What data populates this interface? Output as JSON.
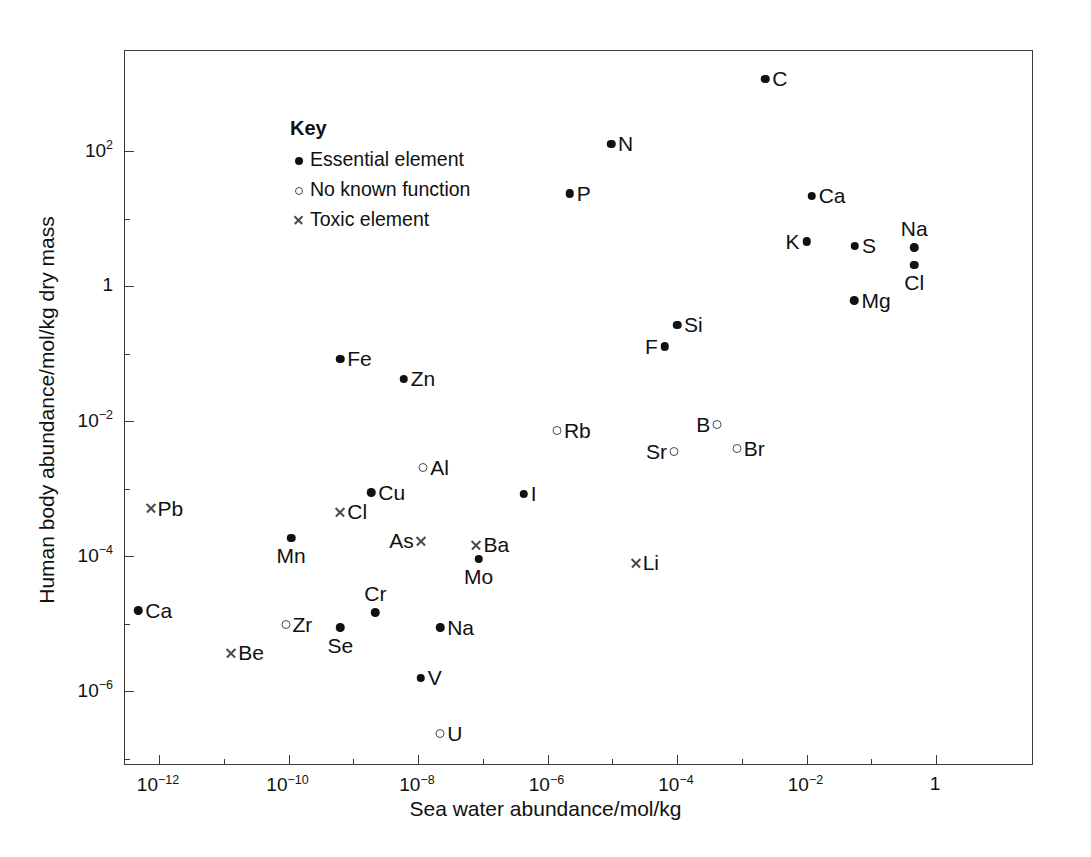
{
  "chart_data": {
    "type": "scatter",
    "title": "",
    "xlabel": "Sea water abundance/mol/kg",
    "ylabel": "Human body abundance/mol/kg dry mass",
    "xscale": "log",
    "yscale": "log",
    "xlim": [
      6.3e-14,
      0.63
    ],
    "ylim": [
      1.5e-07,
      1600.0
    ],
    "grid": false,
    "legend_position": "top-left",
    "x_tick_labels": [
      "10⁻¹²",
      "10⁻¹⁰",
      "10⁻⁸",
      "10⁻⁶",
      "10⁻⁴",
      "10⁻²",
      "1"
    ],
    "x_tick_values": [
      1e-12,
      1e-10,
      1e-08,
      1e-06,
      0.0001,
      0.01,
      1
    ],
    "y_tick_labels": [
      "10²",
      "1",
      "10⁻²",
      "10⁻⁴",
      "10⁻⁶"
    ],
    "y_tick_values": [
      100,
      1,
      0.01,
      0.0001,
      1e-06
    ],
    "x_minor_values": [
      1e-11,
      1e-09,
      1e-07,
      1e-05,
      0.001,
      0.1
    ],
    "y_minor_values": [
      10,
      0.1,
      0.001,
      1e-05,
      1e-07
    ],
    "series": [
      {
        "name": "Essential element",
        "marker": "filled-circle"
      },
      {
        "name": "No known function",
        "marker": "open-circle"
      },
      {
        "name": "Toxic element",
        "marker": "cross"
      }
    ],
    "points": [
      {
        "label": "C",
        "x": 0.0023,
        "y": 1200.0,
        "marker": "filled-circle",
        "label_pos": "right"
      },
      {
        "label": "N",
        "x": 9.6e-06,
        "y": 130.0,
        "marker": "filled-circle",
        "label_pos": "right"
      },
      {
        "label": "P",
        "x": 2.2e-06,
        "y": 24.0,
        "marker": "filled-circle",
        "label_pos": "right"
      },
      {
        "label": "Ca",
        "x": 0.012,
        "y": 22.0,
        "marker": "filled-circle",
        "label_pos": "right"
      },
      {
        "label": "K",
        "x": 0.01,
        "y": 4.7,
        "marker": "filled-circle",
        "label_pos": "left"
      },
      {
        "label": "S",
        "x": 0.056,
        "y": 4.0,
        "marker": "filled-circle",
        "label_pos": "right"
      },
      {
        "label": "Na",
        "x": 0.46,
        "y": 3.8,
        "marker": "filled-circle",
        "label_pos": "above"
      },
      {
        "label": "Cl",
        "x": 0.46,
        "y": 2.1,
        "marker": "filled-circle",
        "label_pos": "below"
      },
      {
        "label": "Mg",
        "x": 0.055,
        "y": 0.63,
        "marker": "filled-circle",
        "label_pos": "right"
      },
      {
        "label": "Si",
        "x": 0.0001,
        "y": 0.27,
        "marker": "filled-circle",
        "label_pos": "right"
      },
      {
        "label": "F",
        "x": 6.5e-05,
        "y": 0.13,
        "marker": "filled-circle",
        "label_pos": "left"
      },
      {
        "label": "Fe",
        "x": 6.3e-10,
        "y": 0.085,
        "marker": "filled-circle",
        "label_pos": "right"
      },
      {
        "label": "Zn",
        "x": 6e-09,
        "y": 0.043,
        "marker": "filled-circle",
        "label_pos": "right"
      },
      {
        "label": "Rb",
        "x": 1.4e-06,
        "y": 0.0073,
        "marker": "open-circle",
        "label_pos": "right"
      },
      {
        "label": "B",
        "x": 0.00042,
        "y": 0.009,
        "marker": "open-circle",
        "label_pos": "left"
      },
      {
        "label": "Br",
        "x": 0.00084,
        "y": 0.004,
        "marker": "open-circle",
        "label_pos": "right"
      },
      {
        "label": "Sr",
        "x": 9e-05,
        "y": 0.0036,
        "marker": "open-circle",
        "label_pos": "left"
      },
      {
        "label": "Al",
        "x": 1.2e-08,
        "y": 0.0021,
        "marker": "open-circle",
        "label_pos": "right"
      },
      {
        "label": "Cu",
        "x": 1.9e-09,
        "y": 0.0009,
        "marker": "filled-circle",
        "label_pos": "right"
      },
      {
        "label": "I",
        "x": 4.3e-07,
        "y": 0.00085,
        "marker": "filled-circle",
        "label_pos": "right"
      },
      {
        "label": "Pb",
        "x": 7.4e-13,
        "y": 0.00052,
        "marker": "cross",
        "label_pos": "right"
      },
      {
        "label": "Cl",
        "x": 6.3e-10,
        "y": 0.00046,
        "marker": "cross",
        "label_pos": "right"
      },
      {
        "label": "Mn",
        "x": 1.1e-10,
        "y": 0.00019,
        "marker": "filled-circle",
        "label_pos": "below"
      },
      {
        "label": "As",
        "x": 1.1e-08,
        "y": 0.00017,
        "marker": "cross",
        "label_pos": "left"
      },
      {
        "label": "Ba",
        "x": 8e-08,
        "y": 0.00015,
        "marker": "cross",
        "label_pos": "right"
      },
      {
        "label": "Mo",
        "x": 8.6e-08,
        "y": 9.2e-05,
        "marker": "filled-circle",
        "label_pos": "below"
      },
      {
        "label": "Li",
        "x": 2.3e-05,
        "y": 8.2e-05,
        "marker": "cross",
        "label_pos": "right"
      },
      {
        "label": "Ca",
        "x": 4.8e-13,
        "y": 1.6e-05,
        "marker": "filled-circle",
        "label_pos": "right"
      },
      {
        "label": "Cr",
        "x": 2.2e-09,
        "y": 1.5e-05,
        "marker": "filled-circle",
        "label_pos": "above"
      },
      {
        "label": "Na",
        "x": 2.2e-08,
        "y": 9e-06,
        "marker": "filled-circle",
        "label_pos": "right"
      },
      {
        "label": "Zr",
        "x": 9e-11,
        "y": 1e-05,
        "marker": "open-circle",
        "label_pos": "right"
      },
      {
        "label": "Se",
        "x": 6.3e-10,
        "y": 9e-06,
        "marker": "filled-circle",
        "label_pos": "below"
      },
      {
        "label": "Be",
        "x": 1.3e-11,
        "y": 3.8e-06,
        "marker": "cross",
        "label_pos": "right"
      },
      {
        "label": "V",
        "x": 1.1e-08,
        "y": 1.6e-06,
        "marker": "filled-circle",
        "label_pos": "right"
      },
      {
        "label": "U",
        "x": 2.2e-08,
        "y": 2.4e-07,
        "marker": "open-circle",
        "label_pos": "right"
      }
    ]
  },
  "axes": {
    "x_title": "Sea water abundance/mol/kg",
    "y_title": "Human body abundance/mol/kg dry mass"
  },
  "key": {
    "title": "Key",
    "items": [
      {
        "marker": "filled-circle",
        "label": "Essential element"
      },
      {
        "marker": "open-circle",
        "label": "No known function"
      },
      {
        "marker": "cross",
        "label": "Toxic element"
      }
    ]
  }
}
